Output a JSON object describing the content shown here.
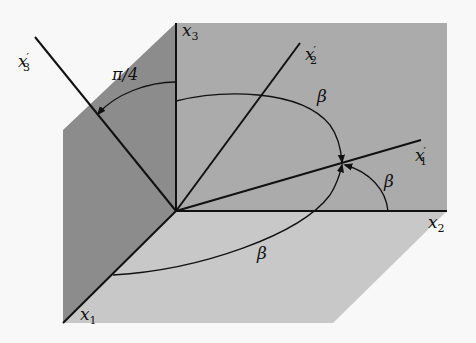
{
  "diagram": {
    "type": "3d-coordinate-rotation",
    "colors": {
      "background": "#f8f8f8",
      "back_wall": "#aaaaaa",
      "left_wall": "#8a8a8a",
      "floor": "#c6c6c6",
      "lines": "#111111"
    },
    "axes": {
      "x1": {
        "base": "x",
        "sub": "1"
      },
      "x2": {
        "base": "x",
        "sub": "2"
      },
      "x3": {
        "base": "x",
        "sub": "3"
      }
    },
    "rotated_axes": {
      "x1p": {
        "base": "x",
        "sub": "1",
        "prime": "′"
      },
      "x2p": {
        "base": "x",
        "sub": "2",
        "prime": "′"
      },
      "x3p": {
        "base": "x",
        "sub": "3",
        "prime": "′"
      }
    },
    "angle_labels": {
      "pi_over_4": "π/4",
      "beta_upper": "β",
      "beta_right": "β",
      "beta_lower": "β"
    }
  }
}
